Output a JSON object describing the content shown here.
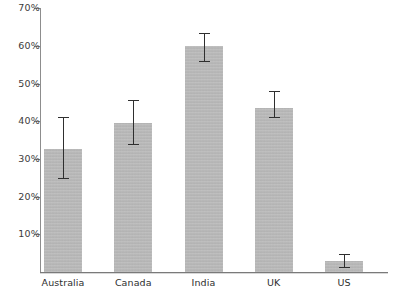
{
  "chart_data": {
    "type": "bar",
    "title": "",
    "subtitle": "",
    "xlabel": "",
    "ylabel": "",
    "categories": [
      "Australia",
      "Canada",
      "India",
      "UK",
      "US"
    ],
    "values": [
      32.5,
      39.5,
      60.0,
      43.5,
      2.8
    ],
    "error_low": [
      25.0,
      34.0,
      56.0,
      41.0,
      1.3
    ],
    "error_high": [
      41.0,
      45.5,
      63.5,
      48.0,
      4.8
    ],
    "ylim": [
      0,
      72
    ],
    "ytick_values": [
      10,
      20,
      30,
      40,
      50,
      60,
      70
    ],
    "ytick_labels": [
      "10%",
      "20%",
      "30%",
      "40%",
      "50%",
      "60%",
      "70%"
    ],
    "grid": false,
    "legend": null,
    "series": [
      {
        "name": "",
        "values": [
          32.5,
          39.5,
          60.0,
          43.5,
          2.8
        ]
      }
    ],
    "colors": {
      "bar_fill": "#b9b9b9",
      "error_bar": "#2f2f2f",
      "axis": "#8d8d8d",
      "tick_label": "#3b3b3b",
      "category_label": "#2e2e2e",
      "background": "#ffffff"
    },
    "units": "percent"
  }
}
